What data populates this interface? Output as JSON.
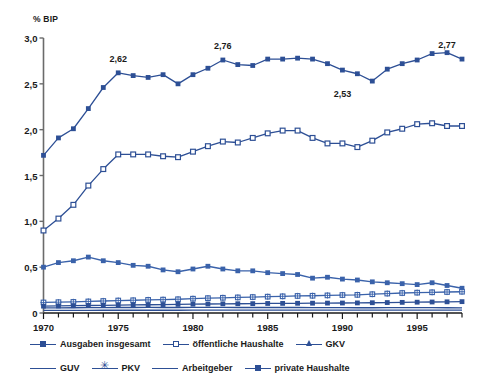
{
  "chart_data": {
    "type": "line",
    "title": "",
    "subtitle": "",
    "xlabel": "",
    "ylabel": "% BIP",
    "ylim": [
      0,
      3.0
    ],
    "xlim": [
      1970,
      1998
    ],
    "grid": false,
    "legend_position": "bottom",
    "ytick_labels": [
      "0",
      "0,5",
      "1,0",
      "1,5",
      "2,0",
      "2,5",
      "3,0"
    ],
    "ytick_values": [
      0,
      0.5,
      1.0,
      1.5,
      2.0,
      2.5,
      3.0
    ],
    "xtick_labels": [
      "1970",
      "1975",
      "1980",
      "1985",
      "1990",
      "1995"
    ],
    "xtick_values": [
      1970,
      1975,
      1980,
      1985,
      1990,
      1995
    ],
    "x": [
      1970,
      1971,
      1972,
      1973,
      1974,
      1975,
      1976,
      1977,
      1978,
      1979,
      1980,
      1981,
      1982,
      1983,
      1984,
      1985,
      1986,
      1987,
      1988,
      1989,
      1990,
      1991,
      1992,
      1993,
      1994,
      1995,
      1996,
      1997,
      1998
    ],
    "annotations": [
      {
        "text": "2,62",
        "x": 1975,
        "y": 2.62,
        "series": "Ausgaben insgesamt"
      },
      {
        "text": "2,76",
        "x": 1982,
        "y": 2.76,
        "series": "Ausgaben insgesamt"
      },
      {
        "text": "2,53",
        "x": 1990,
        "y": 2.53,
        "series": "Ausgaben insgesamt"
      },
      {
        "text": "2,77",
        "x": 1997,
        "y": 2.77,
        "series": "Ausgaben insgesamt"
      }
    ],
    "series": [
      {
        "name": "Ausgaben insgesamt",
        "marker": "square-filled",
        "color": "#2d4f95",
        "values": [
          1.72,
          1.91,
          2.01,
          2.23,
          2.46,
          2.62,
          2.59,
          2.57,
          2.6,
          2.5,
          2.6,
          2.67,
          2.76,
          2.71,
          2.7,
          2.77,
          2.77,
          2.78,
          2.77,
          2.72,
          2.65,
          2.61,
          2.53,
          2.66,
          2.72,
          2.76,
          2.83,
          2.84,
          2.77
        ]
      },
      {
        "name": "öffentliche Haushalte",
        "marker": "square-hollow",
        "color": "#2d4f95",
        "values": [
          0.9,
          1.03,
          1.18,
          1.39,
          1.57,
          1.73,
          1.73,
          1.73,
          1.71,
          1.7,
          1.76,
          1.82,
          1.87,
          1.86,
          1.91,
          1.96,
          1.99,
          1.99,
          1.91,
          1.85,
          1.85,
          1.81,
          1.88,
          1.97,
          2.01,
          2.06,
          2.07,
          2.04,
          2.04
        ]
      },
      {
        "name": "GKV",
        "marker": "square-filled",
        "color": "#3a62aa",
        "values": [
          0.5,
          0.55,
          0.57,
          0.61,
          0.57,
          0.55,
          0.52,
          0.51,
          0.47,
          0.45,
          0.48,
          0.51,
          0.48,
          0.46,
          0.46,
          0.44,
          0.43,
          0.42,
          0.38,
          0.39,
          0.37,
          0.36,
          0.34,
          0.33,
          0.32,
          0.31,
          0.33,
          0.3,
          0.27
        ]
      },
      {
        "name": "GUV",
        "marker": "none",
        "color": "#2d4f95",
        "values": [
          0.055,
          0.056,
          0.057,
          0.058,
          0.059,
          0.06,
          0.06,
          0.061,
          0.06,
          0.06,
          0.061,
          0.062,
          0.061,
          0.06,
          0.06,
          0.06,
          0.06,
          0.06,
          0.059,
          0.058,
          0.058,
          0.057,
          0.057,
          0.058,
          0.058,
          0.058,
          0.058,
          0.057,
          0.056
        ]
      },
      {
        "name": "PKV",
        "marker": "star",
        "color": "#3a62aa",
        "values": [
          0.115,
          0.118,
          0.121,
          0.126,
          0.131,
          0.136,
          0.139,
          0.143,
          0.146,
          0.15,
          0.156,
          0.162,
          0.166,
          0.17,
          0.174,
          0.178,
          0.182,
          0.186,
          0.188,
          0.192,
          0.196,
          0.198,
          0.205,
          0.212,
          0.218,
          0.222,
          0.226,
          0.229,
          0.232
        ]
      },
      {
        "name": "Arbeitgeber",
        "marker": "none",
        "color": "#2d4f95",
        "values": [
          0.028,
          0.028,
          0.029,
          0.029,
          0.03,
          0.03,
          0.03,
          0.03,
          0.03,
          0.03,
          0.031,
          0.031,
          0.031,
          0.031,
          0.031,
          0.031,
          0.031,
          0.031,
          0.031,
          0.031,
          0.031,
          0.031,
          0.031,
          0.031,
          0.031,
          0.031,
          0.031,
          0.031,
          0.031
        ]
      },
      {
        "name": "private Haushalte",
        "marker": "square-filled",
        "color": "#2d4f95",
        "values": [
          0.075,
          0.077,
          0.08,
          0.082,
          0.084,
          0.086,
          0.088,
          0.09,
          0.092,
          0.094,
          0.096,
          0.098,
          0.1,
          0.101,
          0.102,
          0.104,
          0.105,
          0.106,
          0.107,
          0.108,
          0.109,
          0.11,
          0.112,
          0.114,
          0.116,
          0.118,
          0.12,
          0.122,
          0.124
        ]
      }
    ]
  },
  "legend": {
    "rows": [
      [
        {
          "label": "Ausgaben insgesamt",
          "marker": "square-filled"
        },
        {
          "label": "öffentliche Haushalte",
          "marker": "square-hollow"
        },
        {
          "label": "GKV",
          "marker": "triangle"
        }
      ],
      [
        {
          "label": "GUV",
          "marker": "none"
        },
        {
          "label": "PKV",
          "marker": "star"
        },
        {
          "label": "Arbeitgeber",
          "marker": "none"
        },
        {
          "label": "private Haushalte",
          "marker": "square-filled"
        }
      ]
    ]
  }
}
